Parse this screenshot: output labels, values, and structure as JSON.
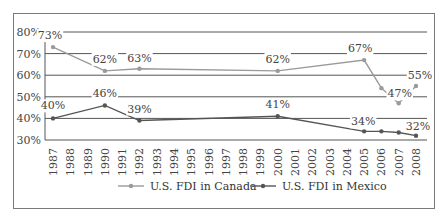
{
  "chart_data": {
    "type": "line",
    "title": "",
    "xlabel": "",
    "ylabel": "",
    "ylim": [
      30,
      80
    ],
    "yticks": [
      "80%",
      "70%",
      "60%",
      "50%",
      "40%",
      "30%"
    ],
    "grid": true,
    "legend_position": "bottom",
    "categories": [
      "1987",
      "1988",
      "1989",
      "1990",
      "1991",
      "1992",
      "1993",
      "1994",
      "1995",
      "1996",
      "1997",
      "1998",
      "1999",
      "2000",
      "2001",
      "2002",
      "2003",
      "2004",
      "2005",
      "2006",
      "2007",
      "2008"
    ],
    "series": [
      {
        "name": "U.S. FDI in Canada",
        "color": "#9a9a9a",
        "points": [
          {
            "x": "1987",
            "y": 73,
            "label": "73%"
          },
          {
            "x": "1990",
            "y": 62,
            "label": "62%"
          },
          {
            "x": "1992",
            "y": 63,
            "label": "63%"
          },
          {
            "x": "2000",
            "y": 62,
            "label": "62%"
          },
          {
            "x": "2005",
            "y": 67,
            "label": "67%"
          },
          {
            "x": "2006",
            "y": 54,
            "label": ""
          },
          {
            "x": "2007",
            "y": 47,
            "label": "47%"
          },
          {
            "x": "2008",
            "y": 55,
            "label": "55%"
          }
        ]
      },
      {
        "name": "U.S. FDI in Mexico",
        "color": "#555555",
        "points": [
          {
            "x": "1987",
            "y": 40,
            "label": "40%"
          },
          {
            "x": "1990",
            "y": 46,
            "label": "46%"
          },
          {
            "x": "1992",
            "y": 39,
            "label": "39%"
          },
          {
            "x": "2000",
            "y": 41,
            "label": "41%"
          },
          {
            "x": "2005",
            "y": 34,
            "label": "34%"
          },
          {
            "x": "2006",
            "y": 34,
            "label": ""
          },
          {
            "x": "2007",
            "y": 33.5,
            "label": ""
          },
          {
            "x": "2008",
            "y": 32,
            "label": "32%"
          }
        ]
      }
    ]
  }
}
